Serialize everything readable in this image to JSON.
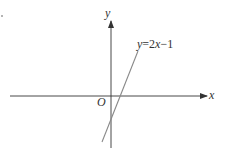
{
  "figure": {
    "type": "coordinate-plane",
    "axes": {
      "x_label": "x",
      "y_label": "y",
      "origin_label": "O"
    },
    "line": {
      "equation_prefix": "y",
      "equation_eq": "=",
      "equation_coef": "2",
      "equation_var": "x",
      "equation_minus": "−",
      "equation_const": "1",
      "slope": 2,
      "intercept": -1
    },
    "colors": {
      "axis": "#333333",
      "line": "#888888",
      "text": "#333333"
    }
  }
}
